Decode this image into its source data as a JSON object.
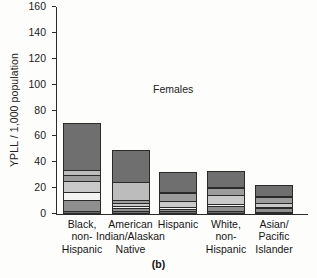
{
  "chart_data": {
    "type": "bar",
    "stacked": true,
    "title": "",
    "annotation": "Females",
    "panel_label": "(b)",
    "xlabel": "",
    "ylabel": "YPLL / 1,000 population",
    "ylim": [
      0,
      160
    ],
    "ytick_values": [
      0,
      20,
      40,
      60,
      80,
      100,
      120,
      140,
      160
    ],
    "ytick_labels": [
      "0",
      "20",
      "40",
      "60",
      "80",
      "100",
      "120",
      "140",
      "160"
    ],
    "grid": false,
    "legend": "none",
    "categories": [
      "Black,\nnon-\nHispanic",
      "American\nIndian/Alaskan\nNative",
      "Hispanic",
      "White,\nnon-\nHispanic",
      "Asian/\nPacific\nIslander"
    ],
    "category_lines": [
      [
        "Black,",
        "non-",
        "Hispanic"
      ],
      [
        "American",
        "Indian/Alaskan",
        "Native"
      ],
      [
        "Hispanic"
      ],
      [
        "White,",
        "non-",
        "Hispanic"
      ],
      [
        "Asian/",
        "Pacific",
        "Islander"
      ]
    ],
    "totals": [
      70.5,
      49.8,
      32.5,
      33.5,
      22.8
    ],
    "series": [
      {
        "name": "segment-1",
        "color": "#6e6e6e",
        "values": [
          1.6,
          1.4,
          1.3,
          1.2,
          1.2
        ]
      },
      {
        "name": "segment-2",
        "color": "#8f8f8f",
        "values": [
          8.4,
          2.3,
          1.8,
          4.8,
          3.0
        ]
      },
      {
        "name": "segment-3",
        "color": "#f4f4f2",
        "values": [
          6.4,
          2.0,
          1.6,
          1.4,
          1.0
        ]
      },
      {
        "name": "segment-4",
        "color": "#c9c9c9",
        "values": [
          8.6,
          2.3,
          4.6,
          7.4,
          3.0
        ]
      },
      {
        "name": "segment-5",
        "color": "#9c9c9c",
        "values": [
          5.2,
          2.6,
          6.8,
          5.8,
          5.0
        ]
      },
      {
        "name": "segment-6",
        "color": "#bcbcbc",
        "values": [
          3.6,
          13.8,
          0.9,
          0.8,
          0.8
        ]
      },
      {
        "name": "segment-7",
        "color": "#6f6f6f",
        "values": [
          36.7,
          25.4,
          15.5,
          12.1,
          8.8
        ]
      }
    ]
  }
}
